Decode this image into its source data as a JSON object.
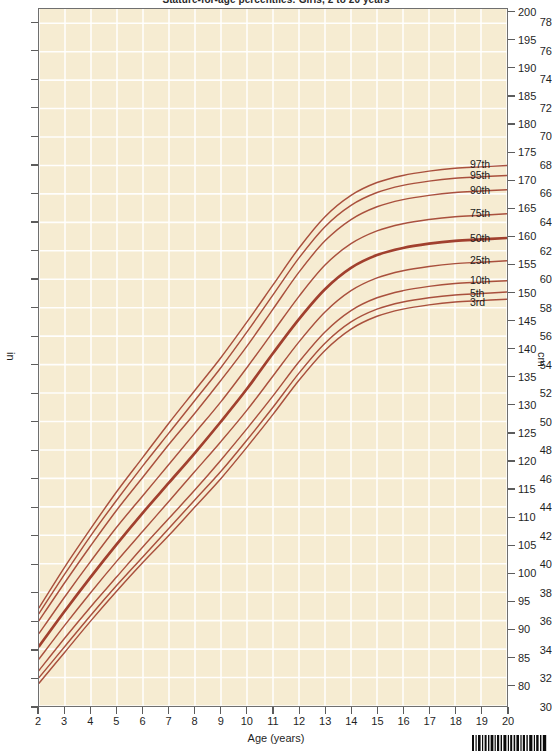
{
  "chart": {
    "title": "Stature-for-age percentiles: Girls, 2 to 20 years",
    "x_axis_caption": "Age (years)",
    "left_unit": "in",
    "right_unit": "cm"
  },
  "chart_data": {
    "type": "line",
    "title": "Stature-for-age percentiles: Girls, 2 to 20 years",
    "xlabel": "Age (years)",
    "ylabel": "in",
    "ylabel_secondary": "cm",
    "xlim": [
      2,
      20
    ],
    "ylim": [
      30,
      79
    ],
    "ylim_secondary": [
      75,
      200
    ],
    "grid": true,
    "legend_position": "right-inline-labels",
    "x_ticks": [
      2,
      3,
      4,
      5,
      6,
      7,
      8,
      9,
      10,
      11,
      12,
      13,
      14,
      15,
      16,
      17,
      18,
      19,
      20
    ],
    "y_ticks_in": [
      30,
      32,
      34,
      36,
      38,
      40,
      42,
      44,
      46,
      48,
      50,
      52,
      54,
      56,
      58,
      60,
      62,
      64,
      66,
      68,
      70,
      72,
      74,
      76,
      78
    ],
    "y_ticks_cm": [
      75,
      80,
      85,
      90,
      95,
      100,
      105,
      110,
      115,
      120,
      125,
      130,
      135,
      140,
      145,
      150,
      155,
      160,
      165,
      170,
      175,
      180,
      185,
      190,
      195,
      200
    ],
    "line_color": "#9e3a28",
    "bold_series": "50th",
    "x": [
      2,
      3,
      4,
      5,
      6,
      7,
      8,
      9,
      10,
      11,
      12,
      13,
      14,
      15,
      16,
      17,
      18,
      19,
      20
    ],
    "series": [
      {
        "name": "97th",
        "label": "97th",
        "values": [
          36.9,
          39.8,
          42.5,
          45.1,
          47.5,
          49.9,
          52.2,
          54.5,
          57.0,
          59.6,
          62.2,
          64.4,
          65.9,
          66.8,
          67.3,
          67.6,
          67.8,
          67.9,
          68.0
        ]
      },
      {
        "name": "95th",
        "label": "95th",
        "values": [
          36.5,
          39.3,
          42.0,
          44.5,
          46.9,
          49.2,
          51.5,
          53.8,
          56.3,
          58.9,
          61.5,
          63.7,
          65.2,
          66.1,
          66.6,
          66.9,
          67.1,
          67.2,
          67.3
        ]
      },
      {
        "name": "90th",
        "label": "90th",
        "values": [
          36.0,
          38.7,
          41.3,
          43.8,
          46.1,
          48.4,
          50.6,
          52.9,
          55.3,
          57.9,
          60.5,
          62.7,
          64.2,
          65.1,
          65.6,
          65.9,
          66.1,
          66.2,
          66.3
        ]
      },
      {
        "name": "75th",
        "label": "75th",
        "values": [
          35.1,
          37.7,
          40.2,
          42.6,
          44.8,
          47.0,
          49.2,
          51.4,
          53.8,
          56.3,
          58.8,
          61.0,
          62.5,
          63.4,
          63.9,
          64.2,
          64.4,
          64.5,
          64.6
        ]
      },
      {
        "name": "50th",
        "label": "50th",
        "values": [
          34.2,
          36.7,
          39.1,
          41.4,
          43.6,
          45.7,
          47.8,
          50.0,
          52.3,
          54.8,
          57.2,
          59.3,
          60.8,
          61.7,
          62.2,
          62.5,
          62.7,
          62.8,
          62.9
        ]
      },
      {
        "name": "25th",
        "label": "25th",
        "values": [
          33.3,
          35.7,
          38.0,
          40.2,
          42.3,
          44.4,
          46.5,
          48.6,
          50.8,
          53.2,
          55.6,
          57.7,
          59.2,
          60.1,
          60.6,
          60.9,
          61.1,
          61.2,
          61.3
        ]
      },
      {
        "name": "10th",
        "label": "10th",
        "values": [
          32.5,
          34.8,
          37.0,
          39.1,
          41.2,
          43.2,
          45.2,
          47.3,
          49.5,
          51.8,
          54.2,
          56.3,
          57.8,
          58.7,
          59.2,
          59.5,
          59.7,
          59.8,
          59.9
        ]
      },
      {
        "name": "5th",
        "label": "5th",
        "values": [
          32.0,
          34.2,
          36.4,
          38.5,
          40.5,
          42.5,
          44.5,
          46.5,
          48.7,
          51.0,
          53.4,
          55.5,
          57.0,
          57.9,
          58.4,
          58.7,
          58.9,
          59.0,
          59.1
        ]
      },
      {
        "name": "3rd",
        "label": "3rd",
        "values": [
          31.6,
          33.8,
          36.0,
          38.1,
          40.1,
          42.0,
          44.0,
          46.0,
          48.2,
          50.5,
          52.9,
          55.0,
          56.5,
          57.4,
          57.9,
          58.2,
          58.4,
          58.5,
          58.6
        ]
      }
    ]
  }
}
